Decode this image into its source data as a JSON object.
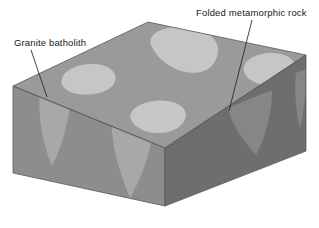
{
  "figure": {
    "kind": "geologic-block-diagram",
    "background_color": "#ffffff"
  },
  "labels": [
    {
      "id": "granite-batholith",
      "text": "Granite batholith",
      "x": 14,
      "y": 46,
      "leader": "M 31 50 L 47 97"
    },
    {
      "id": "folded-metamorphic-rock",
      "text": "Folded metamorphic rock",
      "x": 196,
      "y": 16,
      "leader": "M 252 20 L 229 111"
    }
  ],
  "block": {
    "name": "crustal-block",
    "vertices": {
      "back_top": [
        148,
        22
      ],
      "left_top": [
        13,
        86
      ],
      "front_top": [
        165,
        148
      ],
      "right_top": [
        306,
        55
      ],
      "left_bottom": [
        13,
        173
      ],
      "front_bottom": [
        165,
        206
      ],
      "right_bottom": [
        306,
        151
      ]
    },
    "faces": {
      "top": {
        "name": "top-surface",
        "color": "#9a9a9a",
        "path": "M 148 22 L 306 55 L 165 148 L 13 86 Z"
      },
      "front_left": {
        "name": "front-left-face",
        "color": "#8d8d8d",
        "path": "M 13 86 L 165 148 L 165 206 L 13 173 Z"
      },
      "right": {
        "name": "right-face",
        "color": "#6e6e6e",
        "path": "M 165 148 L 306 55 L 306 151 L 165 206 Z"
      }
    }
  },
  "granite_bodies": {
    "name": "granite-batholith-masses",
    "color_top": "#c6c6c6",
    "color_front": "#a8a8a8",
    "color_right": "#868686",
    "top_blobs": [
      "M 62 85 C 58 73, 75 63, 94 64 C 112 65, 120 75, 113 85 C 104 97, 70 99, 62 85 Z",
      "M 152 47 C 144 33, 168 23, 193 28 C 216 33, 224 48, 214 63 C 200 83, 163 70, 152 47 Z",
      "M 131 120 C 126 108, 148 98, 168 101 C 186 104, 191 116, 180 126 C 166 138, 138 134, 131 120 Z",
      "M 244 72 C 240 59, 262 50, 281 54 C 297 58, 300 71, 289 80 C 275 91, 250 86, 244 72 Z"
    ],
    "front_cones": [
      "M 40 92 C 52 94, 66 97, 70 100 C 69 122, 62 146, 52 166 C 45 150, 37 118, 40 92 Z",
      "M 112 118 C 128 122, 146 128, 152 133 C 150 157, 140 180, 130 198 C 120 174, 110 142, 112 118 Z"
    ],
    "right_cones": [
      "M 228 108 C 244 101, 262 94, 272 90 C 272 112, 266 136, 256 155 C 244 142, 231 124, 228 108 Z",
      "M 296 73 C 302 71, 306 69, 306 69 C 306 92, 304 112, 300 128 C 296 112, 294 90, 296 73 Z"
    ]
  }
}
